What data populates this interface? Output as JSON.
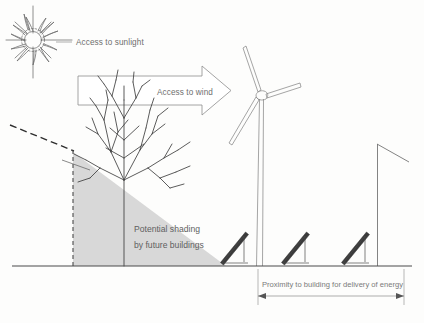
{
  "diagram": {
    "type": "architectural-section-diagram",
    "canvas": {
      "width": 424,
      "height": 323
    },
    "background_color": "#fdfdfc",
    "labels": {
      "sunlight": "Access to sunlight",
      "wind": "Access to wind",
      "shading_line1": "Potential shading",
      "shading_line2": "by future buildings",
      "proximity": "Proximity to building for delivery of energy"
    },
    "icons": {
      "sun": "sun-starburst-icon",
      "tree": "bare-tree-icon",
      "turbine": "wind-turbine-icon",
      "panel": "solar-panel-icon",
      "pole": "mast-pole-icon",
      "wind_arrow": "right-arrow-icon",
      "dimension_arrow": "double-headed-arrow-icon"
    },
    "colors": {
      "shading": "#d8d8d8",
      "line": "#6b6b6b",
      "text": "#6e6e6e",
      "panel": "#3a3a3a",
      "ground": "#4a4a4a"
    },
    "elements": {
      "solar_panel_count": 3,
      "turbine_blade_count": 3,
      "sun_ray_count": 16
    }
  }
}
